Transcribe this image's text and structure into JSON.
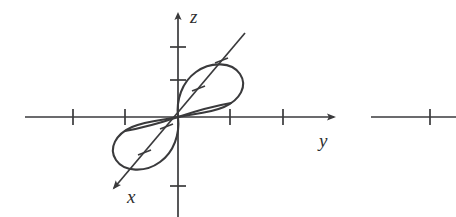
{
  "figure": {
    "background_color": "#ffffff",
    "ink_color": "#3a3a3c",
    "width": 456,
    "height": 217
  },
  "axes": {
    "origin": {
      "x": 178,
      "y": 117
    },
    "z": {
      "label": "z",
      "label_pos": {
        "x": 190,
        "y": 20
      },
      "orientation": "vertical",
      "arrow_end": {
        "x": 178,
        "y": 10
      },
      "line_start": {
        "x": 178,
        "y": 217
      },
      "ticks_above_origin": 2,
      "ticks_below_origin": 1,
      "tick_positions_y": [
        47,
        80,
        186
      ]
    },
    "y": {
      "label": "y",
      "label_pos": {
        "x": 325,
        "y": 143
      },
      "orientation": "horizontal",
      "arrow_end": {
        "x": 338,
        "y": 117
      },
      "line_start": {
        "x": 25,
        "y": 117
      },
      "ticks_left_of_origin": 2,
      "ticks_right_of_origin": 2,
      "tick_positions_x": [
        73,
        125,
        230,
        283
      ]
    },
    "x": {
      "label": "x",
      "label_pos": {
        "x": 132,
        "y": 196
      },
      "orientation": "diagonal-down-left",
      "arrow_end": {
        "x": 110,
        "y": 191
      },
      "line_start": {
        "x": 245,
        "y": 33
      },
      "ticks_count": 4,
      "tick_fractions": [
        0.18,
        0.36,
        0.62,
        0.8
      ]
    }
  },
  "curve": {
    "name": "figure-eight space curve",
    "description": "Two tilted elliptical loops meeting at the origin, upper loop up-right, lower loop down-left",
    "upper_loop": {
      "center": {
        "x": 207,
        "y": 85
      },
      "radius_x": 33,
      "radius_y": 19,
      "rotation_deg": -18
    },
    "lower_loop": {
      "center": {
        "x": 150,
        "y": 150
      },
      "radius_x": 33,
      "radius_y": 19,
      "rotation_deg": -18
    }
  },
  "adjacent_figure_fragment": {
    "description": "Partial horizontal axis belonging to the neighbouring figure",
    "line_start": {
      "x": 371,
      "y": 117
    },
    "line_end": {
      "x": 456,
      "y": 117
    },
    "tick_x": 430
  }
}
